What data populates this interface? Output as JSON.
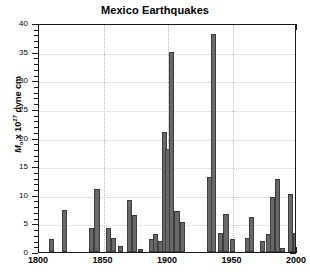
{
  "chart_data": {
    "type": "bar",
    "title": "Mexico Earthquakes",
    "xlabel": "",
    "ylabel": "M_o x 10^27 dyne cm",
    "ylabel_parts": {
      "symbol": "M",
      "subscript": "o",
      "times": " x 10",
      "exponent": "27",
      "units": " dyne cm"
    },
    "xlim": [
      1800,
      2000
    ],
    "ylim": [
      0,
      40
    ],
    "x_ticks": [
      1800,
      1850,
      1900,
      1950,
      2000
    ],
    "x_tick_labels": [
      "1800",
      "1850",
      "1900",
      "1950",
      "2000"
    ],
    "x_minor_step": 10,
    "y_ticks": [
      0,
      5,
      10,
      15,
      20,
      25,
      30,
      35,
      40
    ],
    "y_tick_labels": [
      "0",
      "5",
      "10",
      "15",
      "20",
      "25",
      "30",
      "35",
      "40"
    ],
    "y_minor_step": 1,
    "grid": "dotted vertical at major x ticks and horizontal at major y ticks",
    "legend": "none",
    "bar_color": "#686868",
    "bar_edge_color": "#3d3d3d",
    "bar_width_years": 4,
    "x": [
      1810,
      1820,
      1841,
      1845,
      1854,
      1858,
      1863,
      1870,
      1874,
      1879,
      1887,
      1890,
      1894,
      1897,
      1900,
      1903,
      1907,
      1911,
      1916,
      1921,
      1932,
      1935,
      1941,
      1945,
      1950,
      1957,
      1962,
      1965,
      1973,
      1978,
      1981,
      1985,
      1989,
      1995,
      1999
    ],
    "values": [
      2.3,
      7.4,
      4.2,
      11.0,
      4.2,
      2.4,
      1.1,
      9.1,
      6.5,
      0.6,
      2.3,
      3.2,
      2.0,
      21.0,
      18.0,
      35.0,
      7.1,
      5.2,
      0.0,
      0.0,
      13.1,
      38.0,
      3.3,
      6.7,
      2.3,
      0.0,
      2.5,
      6.1,
      1.9,
      3.1,
      9.6,
      12.8,
      0.7,
      10.1,
      3.4
    ]
  }
}
